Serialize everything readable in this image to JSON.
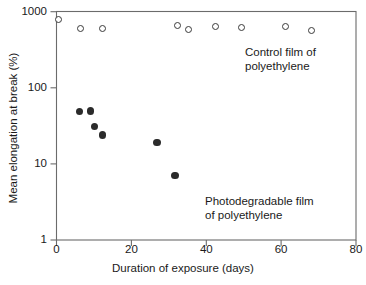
{
  "chart_data": {
    "type": "scatter",
    "title": "",
    "xlabel": "Duration of exposure (days)",
    "ylabel": "Mean elongation at break (%)",
    "xlim": [
      0,
      80
    ],
    "ylim": [
      1,
      1000
    ],
    "yscale": "log",
    "xscale": "linear",
    "grid": false,
    "legend_position": "in-plot annotations",
    "xticks": [
      0,
      20,
      40,
      60,
      80
    ],
    "xtick_labels": [
      "0",
      "20",
      "40",
      "60",
      "80"
    ],
    "yticks": [
      1,
      10,
      100,
      1000
    ],
    "ytick_labels": [
      "1",
      "10",
      "100",
      "1000"
    ],
    "series": [
      {
        "name": "Control film of polyethylene",
        "marker": "open-circle",
        "color": "#3a3a3a",
        "points": [
          {
            "x": 0.5,
            "y": 800
          },
          {
            "x": 6.4,
            "y": 600
          },
          {
            "x": 12.3,
            "y": 600
          },
          {
            "x": 32.3,
            "y": 660
          },
          {
            "x": 35.2,
            "y": 590
          },
          {
            "x": 42.4,
            "y": 640
          },
          {
            "x": 49.3,
            "y": 620
          },
          {
            "x": 61.1,
            "y": 640
          },
          {
            "x": 68.0,
            "y": 570
          }
        ]
      },
      {
        "name": "Photodegradable film of polyethylene",
        "marker": "filled-circle",
        "color": "#2b2b2b",
        "points": [
          {
            "x": 6.1,
            "y": 49
          },
          {
            "x": 9.1,
            "y": 50
          },
          {
            "x": 10.2,
            "y": 31
          },
          {
            "x": 12.3,
            "y": 24
          },
          {
            "x": 26.9,
            "y": 19
          },
          {
            "x": 31.7,
            "y": 7
          }
        ]
      }
    ],
    "annotations": [
      {
        "id": "control",
        "text": "Control film of\npolyethylene",
        "x": 50.4,
        "y": 250
      },
      {
        "id": "photodegradable",
        "text": "Photodegradable film\nof polyethylene",
        "x": 39.7,
        "y": 3.4
      }
    ]
  },
  "axes": {
    "ylabel": "Mean elongation at break (%)",
    "xlabel": "Duration of exposure (days)",
    "ytick_labels": [
      "1000",
      "100",
      "10",
      "1"
    ],
    "xtick_labels": [
      "0",
      "20",
      "40",
      "60",
      "80"
    ]
  },
  "annotations": {
    "control": "Control film of\npolyethylene",
    "photodegradable": "Photodegradable film\nof polyethylene"
  },
  "colors": {
    "axis": "#4d4d4d",
    "open_marker_stroke": "#3a3a3a",
    "filled_marker": "#2b2b2b",
    "text": "#1a1a1a",
    "background": "#ffffff"
  }
}
